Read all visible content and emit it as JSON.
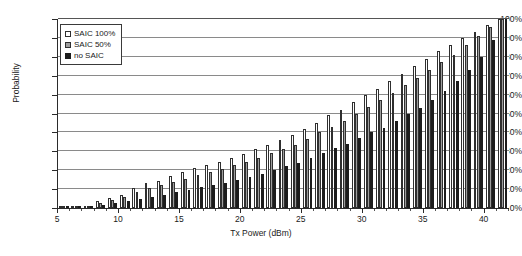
{
  "chart_data": {
    "type": "bar",
    "title": "",
    "xlabel": "Tx Power (dBm)",
    "ylabel": "Probability",
    "xlim": [
      5,
      42
    ],
    "ylim": [
      0,
      1
    ],
    "grid": true,
    "legend_position": "top-left-inside",
    "x_tick_labels": [
      "5",
      "10",
      "15",
      "20",
      "25",
      "30",
      "35",
      "40"
    ],
    "x_tick_values": [
      5,
      10,
      15,
      20,
      25,
      30,
      35,
      40
    ],
    "y_tick_labels": [
      "0%",
      "10%",
      "20%",
      "30%",
      "40%",
      "50%",
      "60%",
      "70%",
      "80%",
      "90%",
      "100%"
    ],
    "y_tick_values": [
      0,
      10,
      20,
      30,
      40,
      50,
      60,
      70,
      80,
      90,
      100
    ],
    "categories": [
      5,
      6,
      7,
      8,
      9,
      10,
      11,
      12,
      13,
      14,
      15,
      16,
      17,
      18,
      19,
      20,
      21,
      22,
      23,
      24,
      25,
      26,
      27,
      28,
      29,
      30,
      31,
      32,
      33,
      34,
      35,
      36,
      37,
      38,
      39,
      40,
      41
    ],
    "series": [
      {
        "name": "SAIC 100%",
        "fill": "#ffffff",
        "edge": "#2f2f2f",
        "values": [
          0.3,
          0.6,
          1.2,
          3.5,
          5.5,
          7.0,
          10.5,
          13.0,
          14.5,
          17.0,
          19.0,
          21.0,
          22.5,
          24.5,
          26.5,
          28.5,
          31.0,
          33.5,
          36.0,
          38.5,
          42.0,
          45.0,
          49.0,
          52.0,
          56.0,
          60.0,
          63.0,
          67.0,
          71.0,
          75.0,
          79.0,
          83.0,
          86.0,
          90.0,
          93.0,
          97.0,
          100.0
        ]
      },
      {
        "name": "SAIC 50%",
        "fill": "#9d9d9d",
        "edge": "#2f2f2f",
        "values": [
          0.2,
          0.5,
          1.0,
          2.5,
          4.5,
          6.0,
          8.5,
          10.5,
          12.0,
          14.0,
          15.5,
          17.5,
          19.0,
          20.5,
          22.5,
          24.5,
          26.5,
          29.0,
          31.0,
          33.5,
          36.5,
          40.0,
          43.0,
          46.0,
          50.0,
          53.5,
          57.0,
          61.0,
          65.0,
          69.0,
          73.0,
          77.0,
          81.0,
          86.0,
          91.0,
          96.0,
          100.0
        ]
      },
      {
        "name": "no SAIC",
        "fill": "#1c1c1c",
        "edge": "#1c1c1c",
        "values": [
          0.1,
          0.3,
          0.6,
          1.5,
          2.5,
          3.5,
          5.0,
          6.0,
          7.0,
          8.5,
          9.5,
          11.0,
          12.0,
          13.5,
          15.0,
          16.5,
          18.0,
          20.0,
          22.0,
          24.0,
          26.5,
          29.0,
          31.5,
          34.0,
          37.0,
          40.0,
          42.5,
          46.0,
          49.5,
          53.0,
          57.0,
          62.0,
          67.0,
          73.0,
          80.0,
          89.0,
          100.0
        ]
      }
    ]
  },
  "legend": {
    "items": [
      {
        "label": "SAIC 100%"
      },
      {
        "label": "SAIC 50%"
      },
      {
        "label": "no SAIC"
      }
    ]
  },
  "axes": {
    "x_title": "Tx Power (dBm)",
    "y_title": "Probability"
  }
}
